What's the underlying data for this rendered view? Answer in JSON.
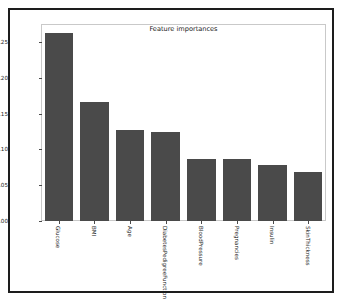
{
  "chart_data": {
    "type": "bar",
    "title": "Feature importances",
    "xlabel": "",
    "ylabel": "",
    "categories": [
      "Glucose",
      "BMI",
      "Age",
      "DiabetesPedigreeFunction",
      "BloodPressure",
      "Pregnancies",
      "Insulin",
      "SkinThickness"
    ],
    "values": [
      0.263,
      0.167,
      0.127,
      0.125,
      0.087,
      0.087,
      0.079,
      0.069
    ],
    "ylim": [
      0.0,
      0.2755
    ],
    "yticks": [
      0.0,
      0.05,
      0.1,
      0.15,
      0.2,
      0.25
    ],
    "ytick_labels": [
      "0.00",
      "0.05",
      "0.10",
      "0.15",
      "0.20",
      "0.25"
    ],
    "grid": false,
    "legend": null,
    "bar_color": "#4a4a4a",
    "xtick_rotation": 90
  },
  "figure": {
    "background_color": "#ffffff",
    "frame_color": "#1d1d1d",
    "axes_border_color": "#c9c9c9"
  }
}
